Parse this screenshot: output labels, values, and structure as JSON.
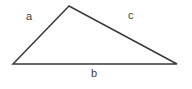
{
  "figure": {
    "kind": "triangle-diagram",
    "background_color": "#ffffff",
    "stroke_color": "#3a3a3a",
    "stroke_width": 1.5,
    "text_color": "#3c3c3c",
    "width": 192,
    "height": 89,
    "vertices": {
      "apex": {
        "x": 69,
        "y": 6
      },
      "left": {
        "x": 13,
        "y": 64
      },
      "right": {
        "x": 177,
        "y": 64
      }
    },
    "polygon_points": "69,6 13,64 177,64",
    "sides": [
      {
        "id": "a",
        "label": "a",
        "from": "left",
        "to": "apex",
        "label_position": {
          "x": 30,
          "y": 17
        }
      },
      {
        "id": "b",
        "label": "b",
        "from": "left",
        "to": "right",
        "label_position": {
          "x": 95,
          "y": 74
        }
      },
      {
        "id": "c",
        "label": "c",
        "from": "apex",
        "to": "right",
        "label_position": {
          "x": 132,
          "y": 16
        }
      }
    ]
  }
}
